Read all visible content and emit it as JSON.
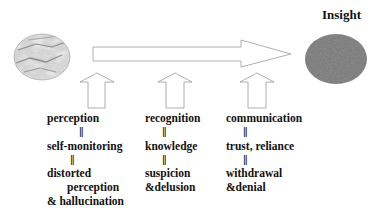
{
  "diagram": {
    "title": "Insight",
    "colors": {
      "arrow_stroke": "#9a9a9a",
      "text": "#111111",
      "start_node": "#cfcfcf",
      "end_node": "#7a7a7a"
    },
    "nodes": {
      "start": {
        "shape": "ellipse",
        "texture": "marble-light"
      },
      "end": {
        "shape": "ellipse",
        "texture": "granite-dark",
        "label": "Insight"
      }
    },
    "main_arrow": {
      "direction": "right",
      "from": "start",
      "to": "end"
    },
    "columns": [
      {
        "lines": [
          "perception",
          "||",
          "self-monitoring",
          "||",
          "distorted",
          "perception",
          "& hallucination"
        ]
      },
      {
        "lines": [
          "recognition",
          "||",
          "knowledge",
          "||",
          "suspicion",
          "&delusion"
        ]
      },
      {
        "lines": [
          "communication",
          "||",
          "trust, reliance",
          "||",
          "withdrawal",
          "&denial"
        ]
      }
    ]
  }
}
